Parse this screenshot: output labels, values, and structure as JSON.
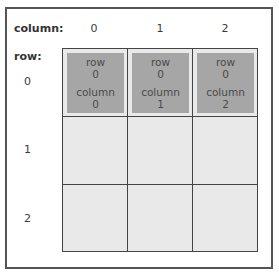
{
  "labels": {
    "column_title": "column:",
    "row_title": "row:"
  },
  "columns": [
    "0",
    "1",
    "2"
  ],
  "rows": [
    "0",
    "1",
    "2"
  ],
  "cells": [
    {
      "row_label": "row",
      "row_value": "0",
      "column_label": "column",
      "column_value": "0"
    },
    {
      "row_label": "row",
      "row_value": "0",
      "column_label": "column",
      "column_value": "1"
    },
    {
      "row_label": "row",
      "row_value": "0",
      "column_label": "column",
      "column_value": "2"
    }
  ],
  "colors": {
    "cell_fill": "#a6a6a6",
    "grid_fill": "#e9e9e9",
    "grid_lines": "#444444"
  }
}
